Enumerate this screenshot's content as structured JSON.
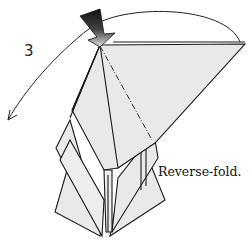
{
  "diagram": {
    "step_number": "3",
    "caption": "Reverse-fold.",
    "elements": {
      "fold_arrow": "curved-arrow-icon",
      "push_arrow": "push-arrow-icon",
      "fold_line": "mountain-fold-line"
    },
    "colors": {
      "paper": "#e9e9e9",
      "line": "#1a1a1a",
      "push_arrow_dark": "#111111",
      "push_arrow_light": "#d8d8d8"
    }
  }
}
